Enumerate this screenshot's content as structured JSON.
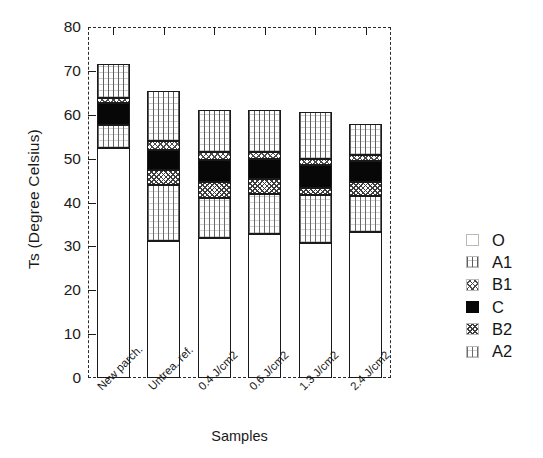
{
  "chart_data": {
    "type": "bar",
    "subtype": "stacked-bar",
    "title": "",
    "xlabel": "Samples",
    "ylabel": "Ts (Degree Celsius)",
    "ylim": [
      0,
      80
    ],
    "yticks": [
      0,
      10,
      20,
      30,
      40,
      50,
      60,
      70,
      80
    ],
    "grid": false,
    "legend_position": "right",
    "categories": [
      "New parch.",
      "Untrea. ref.",
      "0.4 J/cm2",
      "0.6 J/cm2",
      "1.3 J/cm2",
      "2.4 J/cm2"
    ],
    "series": [
      {
        "name": "O",
        "values": [
          52.5,
          31.2,
          32.0,
          32.8,
          30.8,
          33.2
        ]
      },
      {
        "name": "A2",
        "values": [
          5.2,
          12.8,
          9.0,
          9.2,
          11.0,
          8.2
        ]
      },
      {
        "name": "B2",
        "values": [
          0.0,
          3.4,
          3.6,
          3.3,
          1.6,
          3.3
        ]
      },
      {
        "name": "C",
        "values": [
          5.0,
          4.6,
          5.0,
          4.7,
          5.1,
          4.7
        ]
      },
      {
        "name": "B1",
        "values": [
          1.2,
          2.0,
          2.0,
          1.6,
          1.5,
          1.4
        ]
      },
      {
        "name": "A1",
        "values": [
          7.6,
          11.5,
          9.4,
          9.4,
          10.6,
          7.2
        ]
      }
    ],
    "totals": [
      71.5,
      65.5,
      61.0,
      61.0,
      60.6,
      58.0
    ],
    "legend_entries": [
      "O",
      "A1",
      "B1",
      "C",
      "B2",
      "A2"
    ]
  },
  "axes": {
    "y_title": "Ts (Degree Celsius)",
    "x_title": "Samples",
    "y_tick_labels": [
      "0",
      "10",
      "20",
      "30",
      "40",
      "50",
      "60",
      "70",
      "80"
    ],
    "x_tick_labels": [
      "New parch.",
      "Untrea. ref.",
      "0.4 J/cm2",
      "0.6 J/cm2",
      "1.3 J/cm2",
      "2.4 J/cm2"
    ]
  },
  "legend": {
    "items": [
      {
        "label": "O",
        "pattern": "p-O"
      },
      {
        "label": "A1",
        "pattern": "p-A1"
      },
      {
        "label": "B1",
        "pattern": "p-B1"
      },
      {
        "label": "C",
        "pattern": "p-C"
      },
      {
        "label": "B2",
        "pattern": "p-B2"
      },
      {
        "label": "A2",
        "pattern": "p-A2"
      }
    ]
  },
  "colors": {
    "axis": "#1c1c1c",
    "frame": "#2a2a2a",
    "solid_segment": "#070707",
    "background": "#ffffff",
    "text": "#1a1a1a"
  }
}
